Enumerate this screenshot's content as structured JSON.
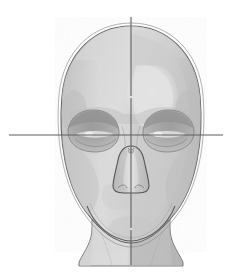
{
  "document": {
    "title": "Human Head Construction Study",
    "subject": "frontal view of skull / head with proportion guidelines",
    "medium": "graphite pencil wash drawing, grayscale",
    "canvas": {
      "width": 232,
      "height": 278,
      "background": "#ffffff"
    }
  },
  "palette": {
    "background": "#ffffff",
    "paper": "#ffffff",
    "outline_dark": "#4a4a4a",
    "outline_mid": "#6f6f6f",
    "outline_soft": "#8d8d8d",
    "guideline": "#5e5e5e",
    "skin_light": "#e4e4e4",
    "skin_base": "#d5d5d5",
    "skin_mid": "#c7c7c7",
    "skin_shadow": "#b6b6b6",
    "skin_deep": "#a6a6a6",
    "socket_dark": "#9a9a9a",
    "socket_deep": "#8b8b8b",
    "highlight": "#eeeeee",
    "neck_shadow": "#bdbdbd"
  },
  "guidelines": {
    "vertical": {
      "label": "central vertical axis",
      "x": 131,
      "y_top": 17,
      "y_bottom": 265,
      "color": "#5e5e5e",
      "width": 1.1
    },
    "horizontal": {
      "label": "eye line / horizontal axis",
      "y": 135,
      "x_left": 9,
      "x_right": 223,
      "color": "#5e5e5e",
      "width": 1.1
    },
    "intersection": {
      "x": 131,
      "y": 135
    }
  },
  "features": [
    {
      "name": "cranium-outline",
      "label": "Cranium outline",
      "note": "double contour at crown"
    },
    {
      "name": "face-mass",
      "label": "Face mass",
      "note": "ovoid, broad at temples"
    },
    {
      "name": "left-eye-socket",
      "label": "Left eye socket",
      "cx": 92,
      "cy": 133
    },
    {
      "name": "right-eye-socket",
      "label": "Right eye socket",
      "cx": 160,
      "cy": 133
    },
    {
      "name": "nose",
      "label": "Nasal aperture",
      "cx": 131,
      "cy": 168
    },
    {
      "name": "jaw-line",
      "label": "Jaw and chin contour",
      "cy": 230
    },
    {
      "name": "neck",
      "label": "Neck",
      "cy": 250
    },
    {
      "name": "forehead-highlight",
      "label": "Forehead highlight",
      "cx": 152,
      "cy": 96
    }
  ],
  "toolbar": {
    "caption": ""
  }
}
